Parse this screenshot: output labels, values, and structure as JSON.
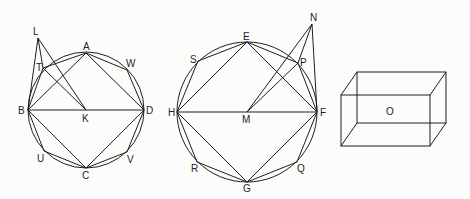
{
  "figures": [
    {
      "id": "fig1",
      "circle": {
        "cx": 86,
        "cy": 110,
        "r": 58,
        "center_label": "K"
      },
      "points": {
        "L": [
          38,
          38
        ],
        "T": [
          43,
          68
        ],
        "A": [
          86,
          53
        ],
        "W": [
          127,
          70
        ],
        "B": [
          28,
          110
        ],
        "K": [
          86,
          110
        ],
        "D": [
          144,
          110
        ],
        "U": [
          44,
          151
        ],
        "C": [
          86,
          168
        ],
        "V": [
          127,
          152
        ]
      },
      "labels": [
        {
          "text": "L",
          "x": 33,
          "y": 35
        },
        {
          "text": "T",
          "x": 36,
          "y": 71
        },
        {
          "text": "A",
          "x": 83,
          "y": 50
        },
        {
          "text": "W",
          "x": 126,
          "y": 67
        },
        {
          "text": "B",
          "x": 18,
          "y": 114
        },
        {
          "text": "K",
          "x": 82,
          "y": 122
        },
        {
          "text": "D",
          "x": 146,
          "y": 114
        },
        {
          "text": "U",
          "x": 37,
          "y": 162
        },
        {
          "text": "C",
          "x": 82,
          "y": 179
        },
        {
          "text": "V",
          "x": 127,
          "y": 163
        }
      ],
      "segments": [
        [
          "B",
          "A"
        ],
        [
          "A",
          "D"
        ],
        [
          "D",
          "C"
        ],
        [
          "C",
          "B"
        ],
        [
          "B",
          "D"
        ],
        [
          "B",
          "T"
        ],
        [
          "T",
          "A"
        ],
        [
          "A",
          "W"
        ],
        [
          "W",
          "D"
        ],
        [
          "D",
          "V"
        ],
        [
          "V",
          "C"
        ],
        [
          "C",
          "U"
        ],
        [
          "U",
          "B"
        ],
        [
          "L",
          "B"
        ],
        [
          "L",
          "T"
        ],
        [
          "L",
          "K"
        ],
        [
          "T",
          "K"
        ]
      ]
    },
    {
      "id": "fig2",
      "circle": {
        "cx": 247,
        "cy": 112,
        "r": 70,
        "center_label": "M"
      },
      "points": {
        "N": [
          312,
          24
        ],
        "E": [
          247,
          42
        ],
        "S": [
          198,
          61
        ],
        "P": [
          298,
          63
        ],
        "H": [
          177,
          112
        ],
        "M": [
          247,
          112
        ],
        "F": [
          317,
          112
        ],
        "R": [
          197,
          162
        ],
        "G": [
          247,
          182
        ],
        "Q": [
          297,
          162
        ]
      },
      "labels": [
        {
          "text": "N",
          "x": 310,
          "y": 21
        },
        {
          "text": "E",
          "x": 243,
          "y": 40
        },
        {
          "text": "S",
          "x": 190,
          "y": 63
        },
        {
          "text": "P",
          "x": 300,
          "y": 66
        },
        {
          "text": "H",
          "x": 168,
          "y": 116
        },
        {
          "text": "M",
          "x": 242,
          "y": 123
        },
        {
          "text": "F",
          "x": 320,
          "y": 116
        },
        {
          "text": "R",
          "x": 191,
          "y": 172
        },
        {
          "text": "G",
          "x": 243,
          "y": 192
        },
        {
          "text": "Q",
          "x": 297,
          "y": 172
        }
      ],
      "segments": [
        [
          "H",
          "E"
        ],
        [
          "E",
          "F"
        ],
        [
          "F",
          "G"
        ],
        [
          "G",
          "H"
        ],
        [
          "H",
          "F"
        ],
        [
          "H",
          "S"
        ],
        [
          "S",
          "E"
        ],
        [
          "E",
          "P"
        ],
        [
          "P",
          "F"
        ],
        [
          "F",
          "Q"
        ],
        [
          "Q",
          "G"
        ],
        [
          "G",
          "R"
        ],
        [
          "R",
          "H"
        ],
        [
          "N",
          "F"
        ],
        [
          "N",
          "P"
        ],
        [
          "N",
          "M"
        ],
        [
          "P",
          "M"
        ]
      ]
    }
  ],
  "box": {
    "front": {
      "x": 341,
      "y": 95,
      "w": 89,
      "h": 51
    },
    "offset": {
      "dx": 16,
      "dy": -23
    },
    "label": {
      "text": "O",
      "x": 386,
      "y": 115
    }
  }
}
